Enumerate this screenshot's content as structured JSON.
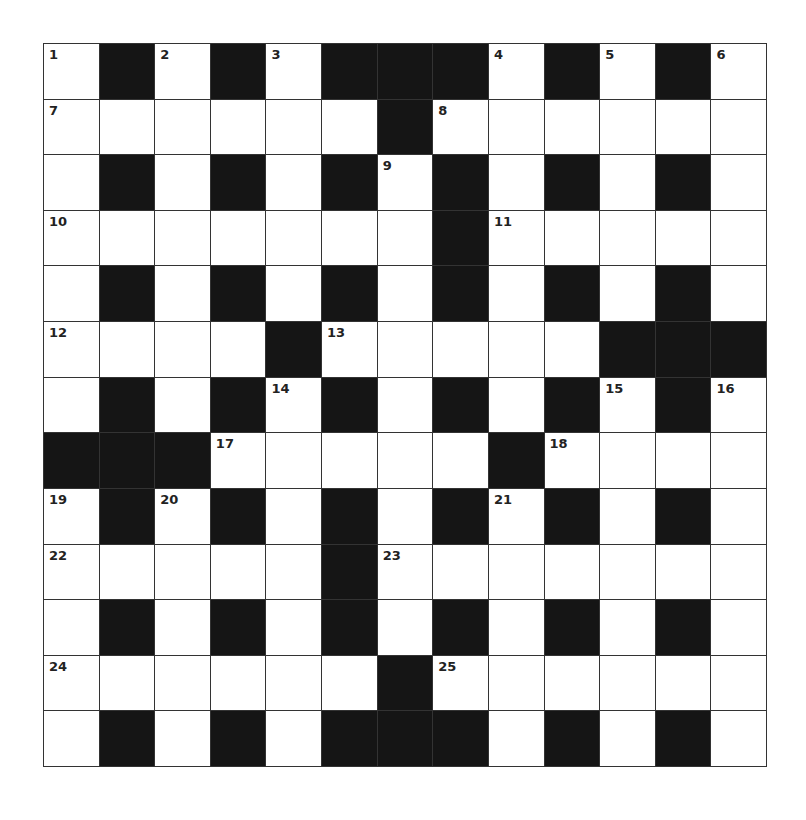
{
  "puzzle": {
    "rows": 13,
    "cols": 13,
    "colors": {
      "block": "#151515",
      "open": "#ffffff",
      "line": "#333333",
      "number": "#222222"
    },
    "layout": [
      "1#2#3###4#5#6",
      "......#......",
      ".#.#.#9#.#.#.",
      ".......#.....",
      ".#.#.#.#.#.#.",
      "....#.....####",
      ".#.#.#.#.#.#.",
      "###....#.....",
      ".#.#.#.#.#.#.",
      ".....#.......",
      ".#.#.#.#.#.#.",
      "......#......",
      ".#.#.###.#.#."
    ],
    "grid": [
      [
        "1",
        "#",
        "2",
        "#",
        "3",
        "#",
        "#",
        "#",
        "4",
        "#",
        "5",
        "#",
        "6"
      ],
      [
        "7",
        "",
        "",
        "",
        "",
        "",
        "#",
        "8",
        "",
        "",
        "",
        "",
        ""
      ],
      [
        "",
        "#",
        "",
        "#",
        "",
        "#",
        "9",
        "#",
        "",
        "#",
        "",
        "#",
        ""
      ],
      [
        "10",
        "",
        "",
        "",
        "",
        "",
        "",
        "#",
        "11",
        "",
        "",
        "",
        ""
      ],
      [
        "",
        "#",
        "",
        "#",
        "",
        "#",
        "",
        "#",
        "",
        "#",
        "",
        "#",
        ""
      ],
      [
        "12",
        "",
        "",
        "",
        "#",
        "13",
        "",
        "",
        "",
        "",
        "#",
        "#",
        "#"
      ],
      [
        "",
        "#",
        "",
        "#",
        "14",
        "#",
        "",
        "#",
        "",
        "#",
        "15",
        "#",
        "16"
      ],
      [
        "#",
        "#",
        "#",
        "17",
        "",
        "",
        "",
        "",
        "#",
        "18",
        "",
        "",
        ""
      ],
      [
        "19",
        "#",
        "20",
        "#",
        "",
        "#",
        "",
        "#",
        "21",
        "#",
        "",
        "#",
        ""
      ],
      [
        "22",
        "",
        "",
        "",
        "",
        "#",
        "23",
        "",
        "",
        "",
        "",
        "",
        ""
      ],
      [
        "",
        "#",
        "",
        "#",
        "",
        "#",
        "",
        "#",
        "",
        "#",
        "",
        "#",
        ""
      ],
      [
        "24",
        "",
        "",
        "",
        "",
        "",
        "#",
        "25",
        "",
        "",
        "",
        "",
        ""
      ],
      [
        "",
        "#",
        "",
        "#",
        "",
        "#",
        "#",
        "#",
        "",
        "#",
        "",
        "#",
        ""
      ]
    ],
    "clue_numbers": [
      "1",
      "2",
      "3",
      "4",
      "5",
      "6",
      "7",
      "8",
      "9",
      "10",
      "11",
      "12",
      "13",
      "14",
      "15",
      "16",
      "17",
      "18",
      "19",
      "20",
      "21",
      "22",
      "23",
      "24",
      "25"
    ]
  }
}
